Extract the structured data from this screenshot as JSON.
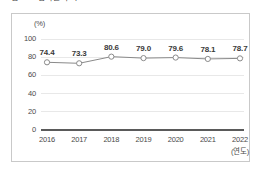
{
  "top_caption": "그림 Ⅲ-1 참여율 추이",
  "chart_data": {
    "type": "line",
    "title": "",
    "xlabel": "(연도)",
    "ylabel": "(%)",
    "categories": [
      "2016",
      "2017",
      "2018",
      "2019",
      "2020",
      "2021",
      "2022"
    ],
    "values": [
      74.4,
      73.3,
      80.6,
      79.0,
      79.6,
      78.1,
      78.7
    ],
    "point_labels": [
      "74.4",
      "73.3",
      "80.6",
      "79.0",
      "79.6",
      "78.1",
      "78.7"
    ],
    "yticks": [
      "100",
      "80",
      "60",
      "40",
      "20",
      "0"
    ],
    "ytick_values": [
      100,
      80,
      60,
      40,
      20,
      0
    ],
    "ylim": [
      0,
      100
    ],
    "grid": true,
    "legend": "none",
    "marker": "open-circle",
    "series_color": "#8a8a8a",
    "marker_fill": "#ffffff",
    "marker_stroke": "#8a8a8a",
    "axis_color": "#5a5a5a",
    "grid_color": "#e8e8e8",
    "label_color": "#3a3a3a",
    "frame_color": "#c9c9c9"
  }
}
